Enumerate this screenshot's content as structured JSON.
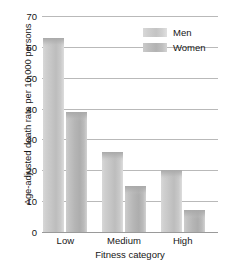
{
  "chart_data": {
    "type": "bar",
    "title": "",
    "xlabel": "Fitness category",
    "ylabel": "Age-adjusted death rate per 10,000 persons",
    "categories": [
      "Low",
      "Medium",
      "High"
    ],
    "series": [
      {
        "name": "Men",
        "values": [
          63,
          26,
          20
        ]
      },
      {
        "name": "Women",
        "values": [
          39,
          15,
          7
        ]
      }
    ],
    "ylim": [
      0,
      70
    ],
    "yticks": [
      0,
      10,
      20,
      30,
      40,
      50,
      60,
      70
    ],
    "ytick_labels": [
      "0",
      "10",
      "20",
      "30",
      "40",
      "50",
      "60",
      "70"
    ],
    "grid": true,
    "legend_position": "top-right",
    "colors": {
      "men": "#c6c6c6",
      "women": "#b5b5b5",
      "gridline": "#b9b9b9",
      "text": "#161616",
      "background": "#ffffff"
    }
  }
}
